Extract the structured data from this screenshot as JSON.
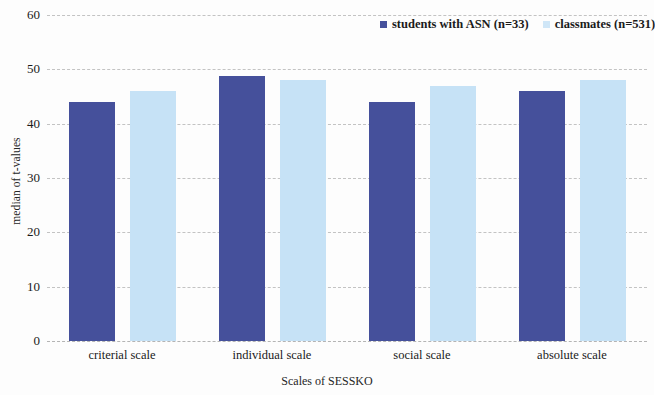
{
  "chart_data": {
    "type": "bar",
    "title": "",
    "xlabel": "Scales of SESSKO",
    "ylabel": "median of t-values",
    "categories": [
      "criterial scale",
      "individual scale",
      "social scale",
      "absolute scale"
    ],
    "series": [
      {
        "name": "students with ASN (n=33)",
        "color": "#45509b",
        "values": [
          44,
          48.8,
          44,
          46
        ]
      },
      {
        "name": "classmates (n=531)",
        "color": "#c6e2f6",
        "values": [
          46,
          48,
          47,
          48
        ]
      }
    ],
    "ylim": [
      0,
      60
    ],
    "yticks": [
      "0",
      "10",
      "20",
      "30",
      "40",
      "50",
      "60"
    ],
    "ytick_values": [
      0,
      10,
      20,
      30,
      40,
      50,
      60
    ],
    "grid": true,
    "legend_position": "top-right"
  }
}
